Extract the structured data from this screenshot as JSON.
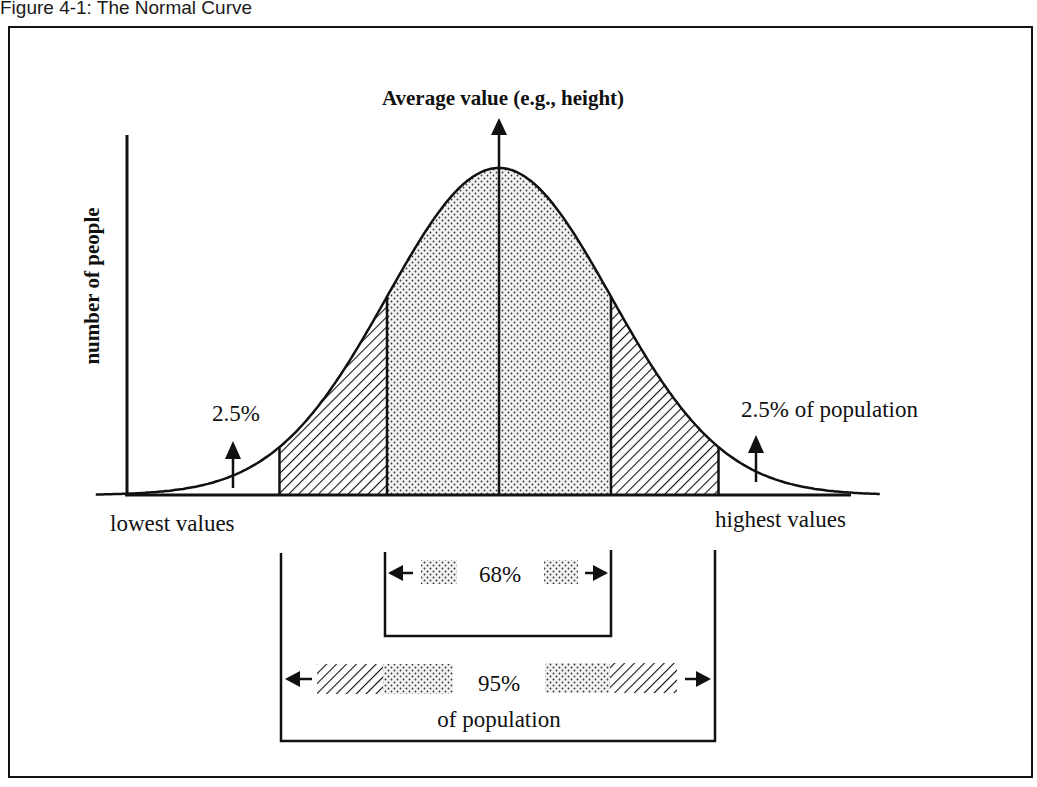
{
  "figure": {
    "title": "Figure 4-1:  The Normal Curve"
  },
  "chart_data": {
    "type": "area",
    "distribution": "normal",
    "title": "The Normal Curve",
    "xlabel_left": "lowest values",
    "xlabel_right": "highest values",
    "ylabel": "number of people",
    "mean_label": "Average value (e.g., height)",
    "mean": 0,
    "sd": 1,
    "x_range_sd": [
      -3.6,
      3.4
    ],
    "regions": [
      {
        "name": "lower tail",
        "from_sd": -3.6,
        "to_sd": -1.96,
        "fill": "none",
        "percent": 2.5
      },
      {
        "name": "lower hatched band",
        "from_sd": -1.96,
        "to_sd": -1,
        "fill": "hatch"
      },
      {
        "name": "central 68%",
        "from_sd": -1,
        "to_sd": 1,
        "fill": "dots",
        "percent": 68
      },
      {
        "name": "upper hatched band",
        "from_sd": 1,
        "to_sd": 1.96,
        "fill": "hatch"
      },
      {
        "name": "upper tail",
        "from_sd": 1.96,
        "to_sd": 3.4,
        "fill": "none",
        "percent": 2.5
      }
    ],
    "annotations": {
      "left_tail": "2.5%",
      "right_tail": "2.5% of population",
      "band_68": "68%",
      "band_95": "95%",
      "band_95_sub": "of population"
    }
  }
}
